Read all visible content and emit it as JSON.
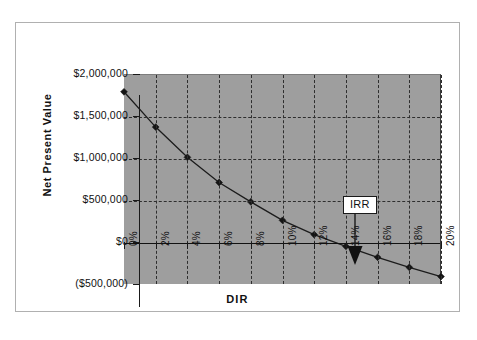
{
  "clipped_fragment": "",
  "chart_data": {
    "type": "line",
    "title": "",
    "xlabel": "DIR",
    "ylabel": "Net Present Value",
    "x": [
      0,
      2,
      4,
      6,
      8,
      10,
      12,
      14,
      16,
      18,
      20
    ],
    "categories": [
      "0%",
      "2%",
      "4%",
      "6%",
      "8%",
      "10%",
      "12%",
      "14%",
      "16%",
      "18%",
      "20%"
    ],
    "values": [
      1800000,
      1380000,
      1020000,
      720000,
      490000,
      270000,
      100000,
      -40000,
      -170000,
      -290000,
      -400000
    ],
    "series": [
      {
        "name": "Net Present Value",
        "values": [
          1800000,
          1380000,
          1020000,
          720000,
          490000,
          270000,
          100000,
          -40000,
          -170000,
          -290000,
          -400000
        ]
      }
    ],
    "ylim": [
      -500000,
      2000000
    ],
    "xlim": [
      0,
      20
    ],
    "ytick_values": [
      2000000,
      1500000,
      1000000,
      500000,
      0,
      -500000
    ],
    "ytick_labels": [
      "$2,000,000",
      "$1,500,000",
      "$1,000,000",
      "$500,000",
      "$0",
      "($500,000)"
    ],
    "xtick_labels": [
      "0%",
      "2%",
      "4%",
      "6%",
      "8%",
      "10%",
      "12%",
      "14%",
      "16%",
      "18%",
      "20%"
    ],
    "grid": true,
    "grid_style": "dashed",
    "legend": "none",
    "zero_line": true,
    "annotations": [
      {
        "label": "IRR",
        "points_to_x": 13.6,
        "points_to_y": 0,
        "style": "boxed-label-with-down-arrow"
      }
    ],
    "colors": {
      "plot_background": "#9e9e9e",
      "grid": "#2e2e2e",
      "series": "#1c1c1c",
      "axis": "#1a1a1a",
      "frame": "#b0b0b0",
      "page_background": "#ffffff"
    }
  }
}
